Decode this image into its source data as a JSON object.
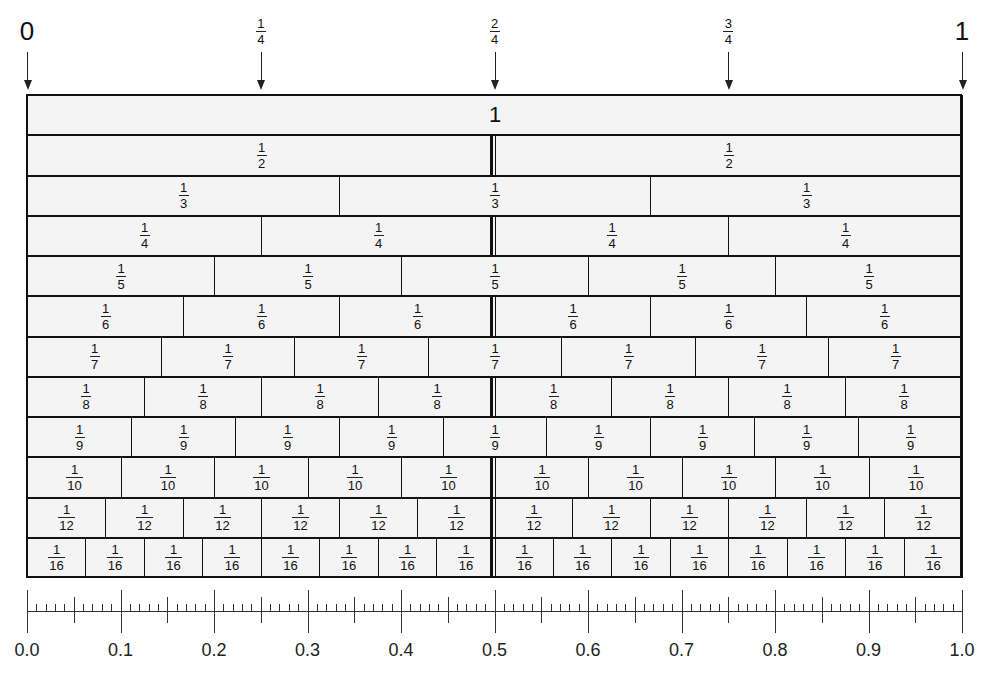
{
  "top_markers": [
    {
      "label_type": "whole",
      "text": "0",
      "position": 0
    },
    {
      "label_type": "fraction",
      "numerator": "1",
      "denominator": "4",
      "position": 0.25
    },
    {
      "label_type": "fraction",
      "numerator": "2",
      "denominator": "4",
      "position": 0.5
    },
    {
      "label_type": "fraction",
      "numerator": "3",
      "denominator": "4",
      "position": 0.75
    },
    {
      "label_type": "whole",
      "text": "1",
      "position": 1
    }
  ],
  "fraction_wall": {
    "rows": [
      {
        "denominator": 1,
        "label": "1"
      },
      {
        "denominator": 2,
        "numerator": "1",
        "den_text": "2"
      },
      {
        "denominator": 3,
        "numerator": "1",
        "den_text": "3"
      },
      {
        "denominator": 4,
        "numerator": "1",
        "den_text": "4"
      },
      {
        "denominator": 5,
        "numerator": "1",
        "den_text": "5"
      },
      {
        "denominator": 6,
        "numerator": "1",
        "den_text": "6"
      },
      {
        "denominator": 7,
        "numerator": "1",
        "den_text": "7"
      },
      {
        "denominator": 8,
        "numerator": "1",
        "den_text": "8"
      },
      {
        "denominator": 9,
        "numerator": "1",
        "den_text": "9"
      },
      {
        "denominator": 10,
        "numerator": "1",
        "den_text": "10"
      },
      {
        "denominator": 12,
        "numerator": "1",
        "den_text": "12"
      },
      {
        "denominator": 16,
        "numerator": "1",
        "den_text": "16"
      }
    ]
  },
  "ruler": {
    "min": 0.0,
    "max": 1.0,
    "major_step": 0.1,
    "mid_step": 0.05,
    "minor_step": 0.01,
    "labels": [
      "0.0",
      "0.1",
      "0.2",
      "0.3",
      "0.4",
      "0.5",
      "0.6",
      "0.7",
      "0.8",
      "0.9",
      "1.0"
    ]
  },
  "colors": {
    "cell_fill": "#f4f4f4",
    "line": "#111111",
    "background": "#ffffff"
  }
}
